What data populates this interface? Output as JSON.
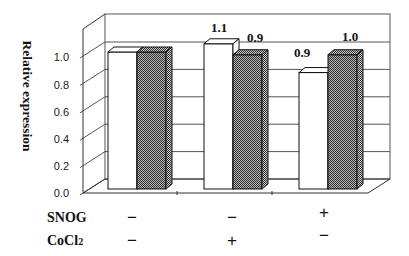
{
  "chart_data": {
    "type": "bar",
    "style": "3d-clustered-column",
    "title": "",
    "xlabel": "",
    "ylabel": "Relative expression",
    "ylim": [
      0,
      1.2
    ],
    "yticks": [
      0.0,
      0.2,
      0.4,
      0.6,
      0.8,
      1.0
    ],
    "ytick_labels": [
      "0.0",
      "0.2",
      "0.4",
      "0.6",
      "0.8",
      "1.0"
    ],
    "grid": true,
    "legend": null,
    "categories": [
      "SNOG − / CoCl2 −",
      "SNOG − / CoCl2 +",
      "SNOG + / CoCl2 −"
    ],
    "series": [
      {
        "pattern": "open",
        "values": [
          1.0,
          1.1,
          0.9
        ],
        "plotted_heights": [
          1.0,
          1.06,
          0.85
        ],
        "data_labels": [
          "",
          "1.1",
          "0.9"
        ]
      },
      {
        "pattern": "hatched",
        "values": [
          1.0,
          0.9,
          1.0
        ],
        "plotted_heights": [
          1.0,
          0.98,
          0.98
        ],
        "data_labels": [
          "",
          "0.9",
          "1.0"
        ]
      }
    ]
  },
  "conditions": {
    "rows": [
      {
        "label": "SNOG",
        "label_sub": "",
        "values": [
          "−",
          "−",
          "+"
        ]
      },
      {
        "label": "CoCl",
        "label_sub": "2",
        "values": [
          "−",
          "+",
          "−"
        ]
      }
    ]
  },
  "colors": {
    "background": "#ffffff",
    "open_fill": "#ffffff",
    "hatch_dark": "#2e2e2e",
    "hatch_light": "#b8b8b8",
    "hatch_side_light": "#cfcfcf",
    "outline": "#111111",
    "gridline": "#555555"
  }
}
